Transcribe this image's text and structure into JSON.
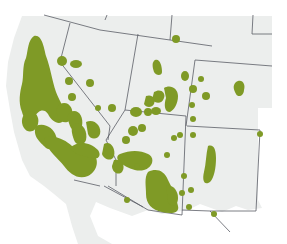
{
  "map": {
    "title": "",
    "region": "Southwestern United States",
    "colors": {
      "background": "#ffffff",
      "land": "#eceeed",
      "border": "#5a5d66",
      "range": "#7f9a26"
    },
    "states_visible": [
      "California",
      "Oregon",
      "Nevada",
      "Idaho",
      "Utah",
      "Wyoming",
      "Arizona",
      "Colorado",
      "New Mexico"
    ],
    "legend": []
  }
}
